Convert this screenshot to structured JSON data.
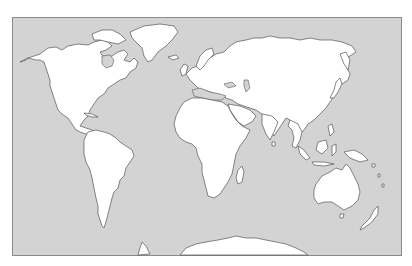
{
  "map": {
    "type": "blank world outline map",
    "projection": "equirectangular-like",
    "colors": {
      "background": "#ffffff",
      "ocean": "#d3d3d3",
      "land": "#ffffff",
      "coastline": "#555555",
      "frame": "#8a8a8a"
    },
    "frame": {
      "x": 12,
      "y": 17,
      "width": 389,
      "height": 238
    },
    "landmasses": [
      {
        "id": "north-america",
        "label": "North America"
      },
      {
        "id": "greenland",
        "label": "Greenland"
      },
      {
        "id": "south-america",
        "label": "South America"
      },
      {
        "id": "europe-asia",
        "label": "Eurasia"
      },
      {
        "id": "africa",
        "label": "Africa"
      },
      {
        "id": "madagascar",
        "label": "Madagascar"
      },
      {
        "id": "arabian-peninsula",
        "label": "Arabia"
      },
      {
        "id": "india",
        "label": "India"
      },
      {
        "id": "southeast-asia",
        "label": "Southeast Asia"
      },
      {
        "id": "japan",
        "label": "Japan"
      },
      {
        "id": "indonesia",
        "label": "Indonesia"
      },
      {
        "id": "new-guinea",
        "label": "New Guinea"
      },
      {
        "id": "australia",
        "label": "Australia"
      },
      {
        "id": "tasmania",
        "label": "Tasmania"
      },
      {
        "id": "new-zealand",
        "label": "New Zealand"
      },
      {
        "id": "british-isles",
        "label": "British Isles"
      },
      {
        "id": "iceland",
        "label": "Iceland"
      },
      {
        "id": "antarctica",
        "label": "Antarctica"
      }
    ],
    "text_labels": []
  }
}
